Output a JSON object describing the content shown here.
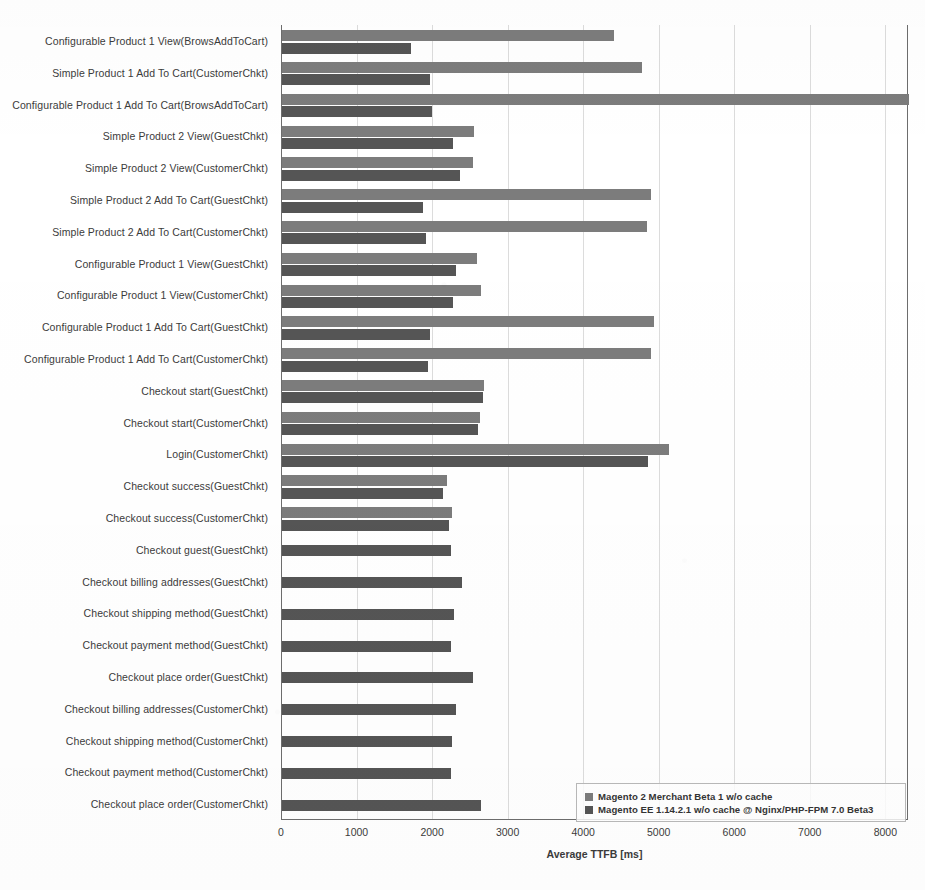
{
  "chart_data": {
    "type": "bar",
    "orientation": "horizontal",
    "title": "",
    "xlabel": "Average TTFB [ms]",
    "ylabel": "",
    "xlim": [
      0,
      8300
    ],
    "xticks": [
      0,
      1000,
      2000,
      3000,
      4000,
      5000,
      6000,
      7000,
      8000
    ],
    "xtick_labels": [
      "0",
      "1000",
      "2000",
      "3000",
      "4000",
      "5000",
      "6000",
      "7000",
      "8000"
    ],
    "grid": true,
    "legend_position": "bottom-right",
    "series": [
      {
        "name": "Magento 2 Merchant Beta 1 w/o cache",
        "color": "#7c7c7c",
        "values": [
          4400,
          4760,
          8300,
          2540,
          2530,
          4880,
          4830,
          2580,
          2640,
          4920,
          4890,
          2670,
          2620,
          5120,
          2180,
          2250,
          null,
          null,
          null,
          null,
          null,
          null,
          null,
          null,
          null
        ]
      },
      {
        "name": "Magento EE 1.14.2.1 w/o cache @ Nginx/PHP-FPM 7.0 Beta3",
        "color": "#555555",
        "values": [
          1710,
          1960,
          1990,
          2270,
          2350,
          1870,
          1910,
          2300,
          2270,
          1960,
          1930,
          2660,
          2590,
          4840,
          2130,
          2210,
          2240,
          2380,
          2280,
          2240,
          2530,
          2300,
          2250,
          2240,
          2630
        ]
      }
    ],
    "categories": [
      "Configurable Product 1 View(BrowsAddToCart)",
      "Simple Product 1 Add To Cart(CustomerChkt)",
      "Configurable Product 1 Add To Cart(BrowsAddToCart)",
      "Simple Product 2 View(GuestChkt)",
      "Simple Product 2 View(CustomerChkt)",
      "Simple Product 2 Add To Cart(GuestChkt)",
      "Simple Product 2 Add To Cart(CustomerChkt)",
      "Configurable Product 1 View(GuestChkt)",
      "Configurable Product 1 View(CustomerChkt)",
      "Configurable Product 1 Add To Cart(GuestChkt)",
      "Configurable Product 1 Add To Cart(CustomerChkt)",
      "Checkout start(GuestChkt)",
      "Checkout start(CustomerChkt)",
      "Login(CustomerChkt)",
      "Checkout success(GuestChkt)",
      "Checkout success(CustomerChkt)",
      "Checkout guest(GuestChkt)",
      "Checkout billing addresses(GuestChkt)",
      "Checkout shipping method(GuestChkt)",
      "Checkout payment method(GuestChkt)",
      "Checkout place order(GuestChkt)",
      "Checkout billing addresses(CustomerChkt)",
      "Checkout shipping method(CustomerChkt)",
      "Checkout payment method(CustomerChkt)",
      "Checkout place order(CustomerChkt)"
    ]
  },
  "legend": {
    "items": [
      {
        "label": "Magento 2 Merchant Beta 1 w/o cache",
        "color": "#7c7c7c"
      },
      {
        "label": "Magento EE 1.14.2.1 w/o cache @ Nginx/PHP-FPM 7.0 Beta3",
        "color": "#555555"
      }
    ]
  },
  "axis": {
    "x_title": "Average TTFB [ms]"
  }
}
